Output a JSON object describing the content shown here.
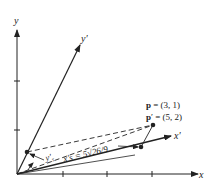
{
  "diagram": {
    "axes": {
      "x_label": "x",
      "y_label": "y",
      "x_prime_label": "x′",
      "y_prime_label": "y′"
    },
    "points": {
      "p_label": "p = (3, 1)",
      "p_prime_label": "p′ = (5, 2)"
    },
    "annotations": {
      "y_s_label": "y′s",
      "x_s_label": "x′s = 5√26/9"
    },
    "colors": {
      "line": "#222222",
      "background": "#ffffff"
    }
  }
}
